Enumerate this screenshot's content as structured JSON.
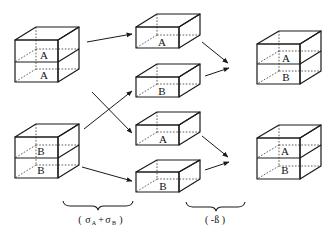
{
  "diagram": {
    "type": "reaction-scheme",
    "stages": [
      {
        "name": "initial",
        "cubes": [
          {
            "id": "AA",
            "layers": [
              "A",
              "A"
            ]
          },
          {
            "id": "BB",
            "layers": [
              "B",
              "B"
            ]
          }
        ]
      },
      {
        "name": "dissociated",
        "slabs": [
          {
            "id": "s1",
            "label": "A"
          },
          {
            "id": "s2",
            "label": "B"
          },
          {
            "id": "s3",
            "label": "A"
          },
          {
            "id": "s4",
            "label": "B"
          }
        ]
      },
      {
        "name": "product",
        "cubes": [
          {
            "id": "AB1",
            "layers": [
              "A",
              "B"
            ]
          },
          {
            "id": "AB2",
            "layers": [
              "A",
              "B"
            ]
          }
        ]
      }
    ],
    "arrows": [
      {
        "from": "AA",
        "to": "s1"
      },
      {
        "from": "AA",
        "to": "s3"
      },
      {
        "from": "BB",
        "to": "s2"
      },
      {
        "from": "BB",
        "to": "s4"
      },
      {
        "from": "s1",
        "to": "AB1"
      },
      {
        "from": "s2",
        "to": "AB1"
      },
      {
        "from": "s3",
        "to": "AB2"
      },
      {
        "from": "s4",
        "to": "AB2"
      }
    ],
    "captions": {
      "step1": "( σA + σB )",
      "step1_main1": "σ",
      "step1_sub1": "A",
      "step1_plus": "+",
      "step1_main2": "σ",
      "step1_sub2": "B",
      "step1_open": "(",
      "step1_close": ")",
      "step2": "( -ß )"
    }
  }
}
